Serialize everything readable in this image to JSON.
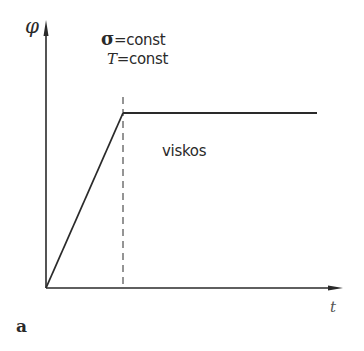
{
  "diagram": {
    "y_axis_label": "φ",
    "x_axis_label": "t",
    "conditions": [
      {
        "symbol": "σ",
        "text": "=const"
      },
      {
        "symbol": "T",
        "text": "=const"
      }
    ],
    "region_label": "viskos",
    "figure_label": "a",
    "colors": {
      "line": "#2a2a2a",
      "background": "#ffffff"
    },
    "curve": {
      "segments": [
        {
          "type": "ramp",
          "from": [
            0,
            0
          ],
          "to": [
            1,
            1
          ]
        },
        {
          "type": "plateau",
          "from": [
            1,
            1
          ],
          "to": [
            3.5,
            1
          ]
        }
      ],
      "marker": {
        "type": "dashed-vertical",
        "x": 1
      }
    }
  }
}
